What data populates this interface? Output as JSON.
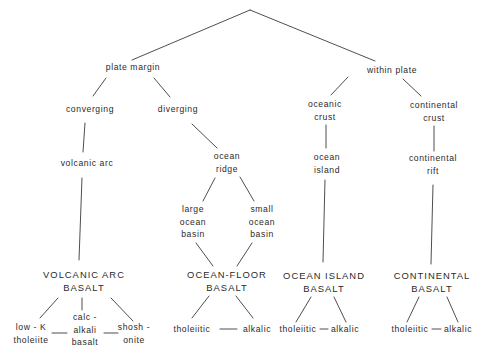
{
  "diagram": {
    "type": "tree",
    "line_color": "#3a3a3a",
    "text_color": "#2a2a2a",
    "nodes": {
      "plate_margin": [
        "plate margin"
      ],
      "within_plate": [
        "within plate"
      ],
      "converging": [
        "converging"
      ],
      "diverging": [
        "diverging"
      ],
      "volcanic_arc": [
        "volcanic arc"
      ],
      "ocean_ridge": [
        "ocean",
        "ridge"
      ],
      "large_ocean_basin": [
        "large",
        "ocean",
        "basin"
      ],
      "small_ocean_basin": [
        "small",
        "ocean",
        "basin"
      ],
      "oceanic_crust": [
        "oceanic",
        "crust"
      ],
      "continental_crust": [
        "continental",
        "crust"
      ],
      "ocean_island": [
        "ocean",
        "island"
      ],
      "continental_rift": [
        "continental",
        "rift"
      ]
    },
    "basalts": {
      "volcanic_arc": [
        "VOLCANIC ARC",
        "BASALT"
      ],
      "ocean_floor": [
        "OCEAN-FLOOR",
        "BASALT"
      ],
      "ocean_island": [
        "OCEAN ISLAND",
        "BASALT"
      ],
      "continental": [
        "CONTINENTAL",
        "BASALT"
      ]
    },
    "subtypes": {
      "volcanic_arc": {
        "low_k": [
          "low - K",
          "tholeiite"
        ],
        "calc_alkali": [
          "calc -",
          "alkali",
          "basalt"
        ],
        "shoshonite": [
          "shosh -",
          "onite"
        ]
      },
      "ocean_floor": {
        "tholeiitic": "tholeiitic",
        "alkalic": "alkalic"
      },
      "ocean_island": {
        "tholeiitic": "tholeiitic",
        "alkalic": "alkalic"
      },
      "continental": {
        "tholeiitic": "tholeiitic",
        "alkalic": "alkalic"
      }
    }
  }
}
